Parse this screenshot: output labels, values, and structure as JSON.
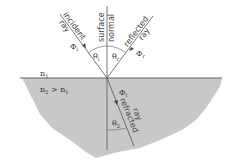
{
  "diagram": {
    "labels": {
      "incident_ray": [
        "incident",
        "ray"
      ],
      "surface_normal": [
        "surface",
        "normal"
      ],
      "reflected_ray": [
        "reflected",
        "ray"
      ],
      "refracted_ray": [
        "refracted",
        "ray"
      ],
      "phi_incident": "Φ",
      "phi_incident_sub": "i",
      "phi_reflected": "Φ",
      "phi_reflected_sub": "r",
      "phi_refracted": "Φ",
      "phi_refracted_sub": "t",
      "theta_incident": "θ",
      "theta_incident_sub": "i",
      "theta_reflected": "θ",
      "theta_reflected_sub": "r",
      "theta_refracted": "θ",
      "theta_refracted_sub": "2",
      "medium1": "n",
      "medium1_sub": "1",
      "medium2": "n",
      "medium2_sub": "2",
      "medium2_relation": " > n",
      "medium2_relation_sub": "1"
    },
    "colors": {
      "medium2_fill": "#c8c8c8",
      "lines": "#555555",
      "text": "#333333"
    }
  }
}
